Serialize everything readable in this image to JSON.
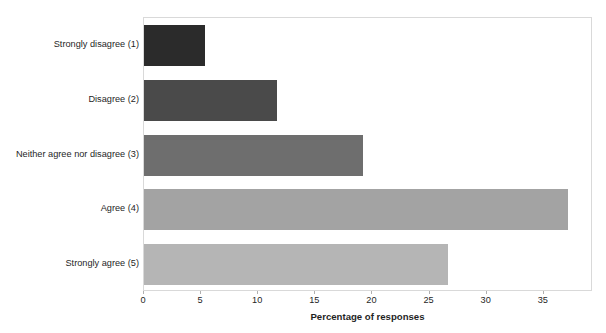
{
  "chart_data": {
    "type": "bar",
    "orientation": "horizontal",
    "title": "",
    "xlabel": "Percentage of responses",
    "ylabel": "",
    "categories": [
      "Strongly disagree (1)",
      "Disagree (2)",
      "Neither agree nor disagree (3)",
      "Agree (4)",
      "Strongly agree (5)"
    ],
    "values": [
      5.3,
      11.6,
      19.2,
      37.1,
      26.6
    ],
    "bar_colors": [
      "#2b2b2b",
      "#4a4a4a",
      "#6e6e6e",
      "#a3a3a3",
      "#b5b5b5"
    ],
    "xlim": [
      0,
      39.3
    ],
    "xticks": [
      0,
      5,
      10,
      15,
      20,
      25,
      30,
      35
    ],
    "xtick_labels": [
      "0",
      "5",
      "10",
      "15",
      "20",
      "25",
      "30",
      "35"
    ],
    "grid": false,
    "legend": false,
    "plot_border_color": "#d9d9d9",
    "background_color": "#ffffff"
  }
}
